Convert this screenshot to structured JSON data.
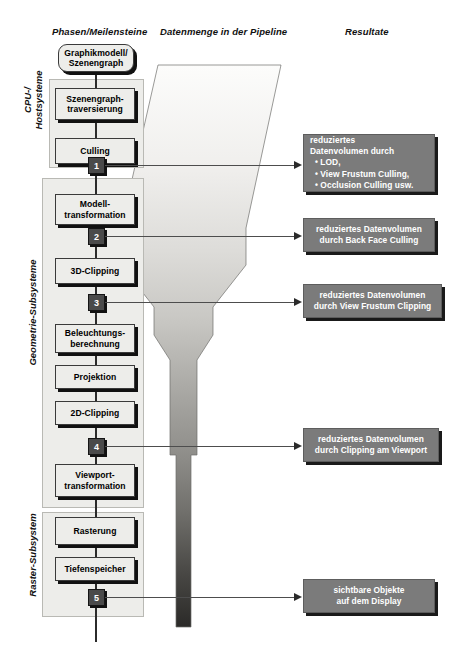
{
  "headers": {
    "phases": "Phasen/Meilensteine",
    "data_volume": "Datenmenge in der Pipeline",
    "results": "Resultate"
  },
  "side_labels": [
    {
      "id": "cpu",
      "line1": "CPU-/",
      "line2": "Hostsysteme"
    },
    {
      "id": "geometry",
      "line1": "Geometrie-Subsysteme",
      "line2": ""
    },
    {
      "id": "raster",
      "line1": "Raster-Subsystem",
      "line2": ""
    }
  ],
  "stages": [
    {
      "id": "graphikmodell",
      "line1": "Graphikmodell/",
      "line2": "Szenengraph"
    },
    {
      "id": "szenengraph-trav",
      "line1": "Szenengraph-",
      "line2": "traversierung"
    },
    {
      "id": "culling",
      "line1": "Culling",
      "line2": ""
    },
    {
      "id": "modelltransform",
      "line1": "Modell-",
      "line2": "transformation"
    },
    {
      "id": "3d-clipping",
      "line1": "3D-Clipping",
      "line2": ""
    },
    {
      "id": "beleuchtung",
      "line1": "Beleuchtungs-",
      "line2": "berechnung"
    },
    {
      "id": "projektion",
      "line1": "Projektion",
      "line2": ""
    },
    {
      "id": "2d-clipping",
      "line1": "2D-Clipping",
      "line2": ""
    },
    {
      "id": "viewporttransform",
      "line1": "Viewport-",
      "line2": "transformation"
    },
    {
      "id": "rasterung",
      "line1": "Rasterung",
      "line2": ""
    },
    {
      "id": "tiefenspeicher",
      "line1": "Tiefenspeicher",
      "line2": ""
    }
  ],
  "markers": [
    {
      "id": "m1",
      "label": "1"
    },
    {
      "id": "m2",
      "label": "2"
    },
    {
      "id": "m3",
      "label": "3"
    },
    {
      "id": "m4",
      "label": "4"
    },
    {
      "id": "m5",
      "label": "5"
    }
  ],
  "results": [
    {
      "id": "r1",
      "line1": "reduziertes",
      "line2": "Datenvolumen durch",
      "bullets": [
        "• LOD,",
        "• View Frustum Culling,",
        "• Occlusion Culling usw."
      ]
    },
    {
      "id": "r2",
      "line1": "reduziertes Datenvolumen",
      "line2": "durch Back Face Culling",
      "bullets": []
    },
    {
      "id": "r3",
      "line1": "reduziertes Datenvolumen",
      "line2": "durch View Frustum Clipping",
      "bullets": []
    },
    {
      "id": "r4",
      "line1": "reduziertes Datenvolumen",
      "line2": "durch Clipping am Viewport",
      "bullets": []
    },
    {
      "id": "r5",
      "line1": "sichtbare Objekte",
      "line2": "auf dem Display",
      "bullets": []
    }
  ],
  "colors": {
    "result_box_fill": "#7b7b7b",
    "stage_box_fill": "#ededea",
    "group_fill": "#ededea",
    "marker_fill": "#4a4a4a",
    "funnel_top": "#f2f2f0",
    "funnel_bottom": "#2e2c2a"
  }
}
